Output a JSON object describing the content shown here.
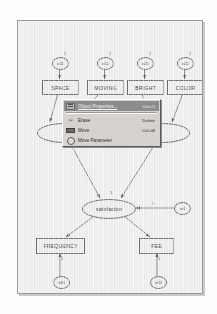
{
  "app": {
    "window_title": "",
    "canvas_background": "#eeeeee",
    "ink_color": "#6e6e6e",
    "menu_highlight_color": "#8c8c8c",
    "menu_face_color": "#d6d3ce"
  },
  "diagram": {
    "type": "sem-path-diagram",
    "observed_variables": [
      {
        "id": "space",
        "label": "SPACE",
        "x": 22,
        "y": 57,
        "w": 35,
        "h": 13
      },
      {
        "id": "moving",
        "label": "MOVING",
        "x": 67,
        "y": 57,
        "w": 35,
        "h": 13
      },
      {
        "id": "bright",
        "label": "BRIGHT",
        "x": 107,
        "y": 57,
        "w": 35,
        "h": 13
      },
      {
        "id": "color",
        "label": "COLOR",
        "x": 147,
        "y": 57,
        "w": 35,
        "h": 13
      },
      {
        "id": "frequency",
        "label": "FREQUENCY",
        "x": 16,
        "y": 215,
        "w": 47,
        "h": 14
      },
      {
        "id": "fee",
        "label": "FEE",
        "x": 119,
        "y": 215,
        "w": 33,
        "h": 14
      }
    ],
    "latent_variables": [
      {
        "id": "satisfaction",
        "label": "satisfaction",
        "shape": "ellipse",
        "x": 62,
        "y": 176,
        "w": 52,
        "h": 18
      },
      {
        "id": "latent-left",
        "label": "",
        "shape": "ellipse",
        "x": 17,
        "y": 100,
        "w": 52,
        "h": 18
      },
      {
        "id": "latent-right",
        "label": "",
        "shape": "ellipse",
        "x": 116,
        "y": 100,
        "w": 52,
        "h": 18
      }
    ],
    "error_terms": [
      {
        "id": "e11",
        "label": "e11",
        "x": 32,
        "y": 34
      },
      {
        "id": "e12",
        "label": "e12",
        "x": 77,
        "y": 34
      },
      {
        "id": "e21",
        "label": "e21",
        "x": 117,
        "y": 34
      },
      {
        "id": "e22",
        "label": "e22",
        "x": 157,
        "y": 34
      },
      {
        "id": "e31",
        "label": "e31",
        "x": 33,
        "y": 243
      },
      {
        "id": "e32",
        "label": "e32",
        "x": 130,
        "y": 243
      },
      {
        "id": "e4",
        "label": "e4",
        "x": 158,
        "y": 178
      }
    ],
    "path_parameter_labels": [
      {
        "id": "p-e11",
        "text": "1",
        "x": 46,
        "y": 30
      },
      {
        "id": "p-e12",
        "text": "1",
        "x": 91,
        "y": 30
      },
      {
        "id": "p-e21",
        "text": "1",
        "x": 131,
        "y": 30
      },
      {
        "id": "p-e22",
        "text": "1",
        "x": 171,
        "y": 30
      },
      {
        "id": "p-sat",
        "text": "1",
        "x": 92,
        "y": 168
      },
      {
        "id": "p-e4",
        "text": "1",
        "x": 132,
        "y": 180
      },
      {
        "id": "p-e31",
        "text": "1",
        "x": 41,
        "y": 234
      },
      {
        "id": "p-e32",
        "text": "1",
        "x": 138,
        "y": 234
      }
    ]
  },
  "context_menu": {
    "name": "object-context-menu",
    "items": [
      {
        "id": "object-properties",
        "label": "Object Properties...",
        "accel": "Ctrl+O",
        "icon": "properties-icon",
        "selected": true,
        "separator_after": true
      },
      {
        "id": "erase",
        "label": "Erase",
        "accel": "Delete",
        "icon": "scissors-icon",
        "selected": false,
        "separator_after": false
      },
      {
        "id": "move",
        "label": "Move",
        "accel": "Ctrl+M",
        "icon": "move-icon",
        "selected": false,
        "separator_after": false
      },
      {
        "id": "move-parameter",
        "label": "Move Parameter",
        "accel": "",
        "icon": "parameter-icon",
        "selected": false,
        "separator_after": false
      }
    ]
  }
}
